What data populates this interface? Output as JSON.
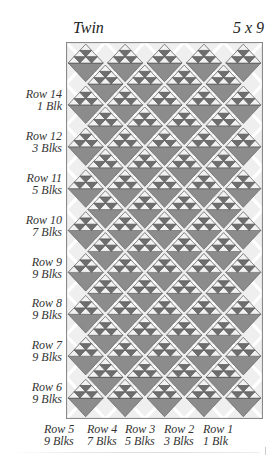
{
  "header": {
    "title": "Twin",
    "layout": "5 x 9"
  },
  "quilt": {
    "columns": 5,
    "rows": 9,
    "colors": {
      "background": "#efefef",
      "border": "#8a8a8a",
      "sashing": "#ffffff",
      "dark": "#8c8c8c",
      "light": "#f2f2f2",
      "small_dark": "#6e6e6e",
      "outline": "#555555"
    }
  },
  "side_labels": [
    {
      "row": "Row 14",
      "blocks": "1 Blk",
      "y": 88
    },
    {
      "row": "Row 12",
      "blocks": "3 Blks",
      "y": 130
    },
    {
      "row": "Row 11",
      "blocks": "5 Blks",
      "y": 172
    },
    {
      "row": "Row 10",
      "blocks": "7 Blks",
      "y": 214
    },
    {
      "row": "Row 9",
      "blocks": "9 Blks",
      "y": 256
    },
    {
      "row": "Row 8",
      "blocks": "9 Blks",
      "y": 297
    },
    {
      "row": "Row 7",
      "blocks": "9 Blks",
      "y": 339
    },
    {
      "row": "Row 6",
      "blocks": "9 Blks",
      "y": 381
    }
  ],
  "bottom_labels": [
    {
      "row": "Row 5",
      "blocks": "9 Blks",
      "x": 44
    },
    {
      "row": "Row 4",
      "blocks": "7 Blks",
      "x": 87
    },
    {
      "row": "Row 3",
      "blocks": "5 Blks",
      "x": 125
    },
    {
      "row": "Row 2",
      "blocks": "3 Blks",
      "x": 164
    },
    {
      "row": "Row 1",
      "blocks": "1 Blk",
      "x": 203
    }
  ]
}
